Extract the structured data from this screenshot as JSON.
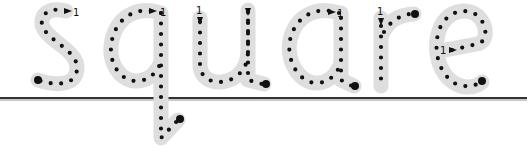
{
  "worksheet": {
    "word": "square",
    "letters": [
      "s",
      "q",
      "u",
      "a",
      "r",
      "e"
    ],
    "stroke_start_label": "1",
    "colors": {
      "track": "#dedede",
      "dots": "#111111",
      "baseline": "#333333",
      "background": "#ffffff"
    }
  }
}
